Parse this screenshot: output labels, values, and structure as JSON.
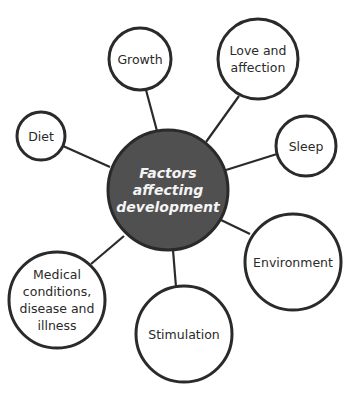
{
  "diagram": {
    "type": "mind-map",
    "colors": {
      "center_fill": "#505050",
      "stroke": "#2a2a2a",
      "node_fill": "#ffffff",
      "center_text": "#f4f4f4",
      "node_text": "#2a2a2a"
    },
    "center": {
      "label_lines": [
        "Factors",
        "affecting",
        "development"
      ]
    },
    "nodes": [
      {
        "id": "growth",
        "label": "Growth"
      },
      {
        "id": "love",
        "label_lines": [
          "Love and",
          "affection"
        ]
      },
      {
        "id": "diet",
        "label": "Diet"
      },
      {
        "id": "sleep",
        "label": "Sleep"
      },
      {
        "id": "environment",
        "label": "Environment"
      },
      {
        "id": "medical",
        "label_lines": [
          "Medical",
          "conditions,",
          "disease and",
          "illness"
        ]
      },
      {
        "id": "stimulation",
        "label": "Stimulation"
      }
    ]
  }
}
